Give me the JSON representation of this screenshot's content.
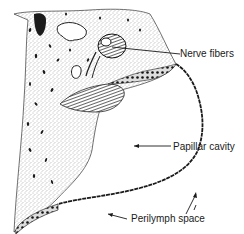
{
  "figure": {
    "type": "anatomical-line-drawing",
    "style": "black ink stipple on white",
    "colors": {
      "ink": "#1a1a1a",
      "background": "#ffffff",
      "stipple": "#555555"
    }
  },
  "labels": [
    {
      "id": "nerve-fibers",
      "text": "Nerve fibers",
      "x": 180,
      "y": 48
    },
    {
      "id": "papillar-cavity",
      "text": "Papillar cavity",
      "x": 173,
      "y": 141
    },
    {
      "id": "perilymph-space",
      "text": "Perilymph space",
      "x": 131,
      "y": 213
    }
  ]
}
